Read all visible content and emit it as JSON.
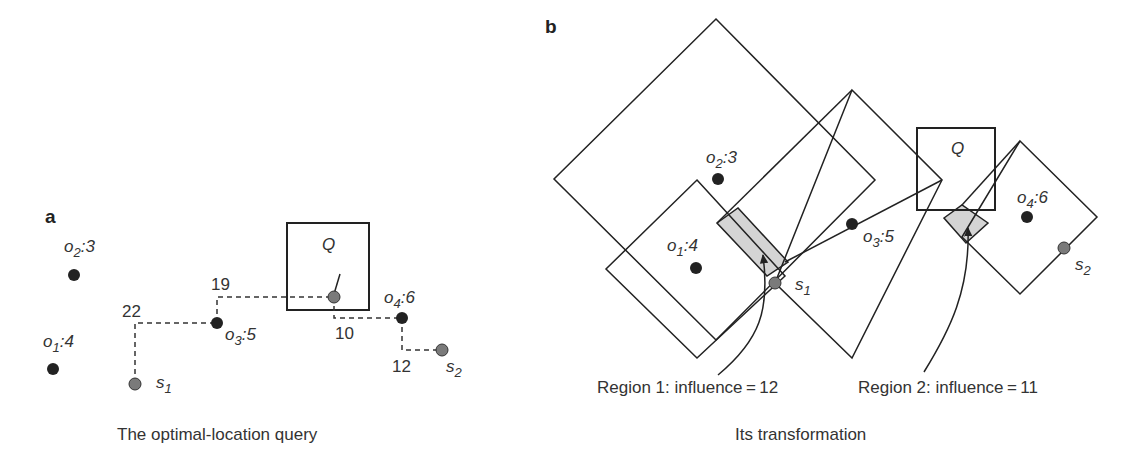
{
  "panel_a": {
    "letter": "a",
    "caption": "The optimal-location query",
    "query_label": "Q",
    "objects": [
      {
        "name": "o",
        "sub": "1",
        "weight": ":4"
      },
      {
        "name": "o",
        "sub": "2",
        "weight": ":3"
      },
      {
        "name": "o",
        "sub": "3",
        "weight": ":5"
      },
      {
        "name": "o",
        "sub": "4",
        "weight": ":6"
      }
    ],
    "sites": [
      {
        "name": "s",
        "sub": "1"
      },
      {
        "name": "s",
        "sub": "2"
      }
    ],
    "distances": [
      "22",
      "19",
      "10",
      "12"
    ]
  },
  "panel_b": {
    "letter": "b",
    "caption": "Its transformation",
    "query_label": "Q",
    "objects": [
      {
        "name": "o",
        "sub": "1",
        "weight": ":4"
      },
      {
        "name": "o",
        "sub": "2",
        "weight": ":3"
      },
      {
        "name": "o",
        "sub": "3",
        "weight": ":5"
      },
      {
        "name": "o",
        "sub": "4",
        "weight": ":6"
      }
    ],
    "sites": [
      {
        "name": "s",
        "sub": "1"
      },
      {
        "name": "s",
        "sub": "2"
      }
    ],
    "regions": [
      {
        "label": "Region 1: influence = 12"
      },
      {
        "label": "Region 2: influence = 11"
      }
    ]
  },
  "colors": {
    "stroke": "#222222",
    "object_dot": "#222222",
    "site_dot": "#7a7a7a",
    "region_fill": "#d4d4d4"
  }
}
